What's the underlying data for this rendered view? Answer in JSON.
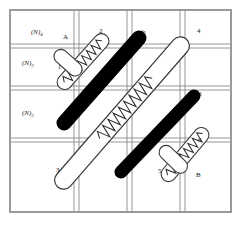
{
  "figure": {
    "background_color": "#ffffff",
    "frame_color": "#9a9a9a",
    "grid_line_color": "#8a8a8a",
    "rod_black_color": "#000000",
    "rod_white_fill": "#ffffff",
    "rod_outline_color": "#3a3a3a"
  },
  "side_labels": [
    {
      "id": "side-label-1",
      "text": "(N)",
      "sub": "4"
    },
    {
      "id": "side-label-2",
      "text": "(N)",
      "sub": "3"
    },
    {
      "id": "side-label-3",
      "text": "(N)",
      "sub": "2"
    }
  ],
  "point_labels": [
    {
      "id": "label-A",
      "text": "A"
    },
    {
      "id": "label-1",
      "text": "1"
    },
    {
      "id": "label-2",
      "text": "2"
    },
    {
      "id": "label-b",
      "text": "b"
    },
    {
      "id": "label-4",
      "text": "4"
    },
    {
      "id": "label-a",
      "text": "a"
    },
    {
      "id": "label-d",
      "text": "d"
    },
    {
      "id": "label-6",
      "text": "6"
    },
    {
      "id": "label-3",
      "text": "3"
    },
    {
      "id": "label-c",
      "text": "c"
    },
    {
      "id": "label-5",
      "text": "5"
    },
    {
      "id": "label-B",
      "text": "B"
    }
  ],
  "rods": [
    {
      "id": "rod-black-upper-left",
      "style": "solid-black",
      "endpoints": [
        "a",
        "b"
      ]
    },
    {
      "id": "rod-black-lower-right",
      "style": "solid-black",
      "endpoints": [
        "c",
        "d"
      ]
    },
    {
      "id": "rod-white-coiled-upper",
      "style": "white-coiled",
      "endpoints": [
        "A",
        "2"
      ]
    },
    {
      "id": "rod-white-coiled-long",
      "style": "white-coiled",
      "endpoints": [
        "3",
        "4"
      ]
    },
    {
      "id": "rod-white-coiled-lower",
      "style": "white-coiled",
      "endpoints": [
        "5",
        "6"
      ]
    }
  ],
  "grid": {
    "horizontal_pairs": 3,
    "vertical_pairs": 3
  }
}
